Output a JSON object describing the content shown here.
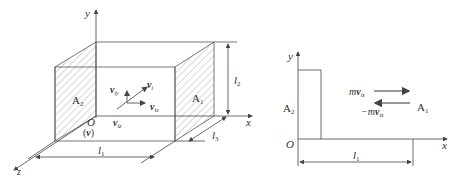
{
  "left_diagram": {
    "axes": {
      "x": "x",
      "y": "y",
      "z": "z",
      "origin": "O"
    },
    "faces": {
      "left": "A",
      "left_sub": "2",
      "right": "A",
      "right_sub": "1"
    },
    "dimensions": {
      "l1": {
        "main": "l",
        "sub": "1"
      },
      "l2": {
        "main": "l",
        "sub": "2"
      },
      "l3": {
        "main": "l",
        "sub": "3"
      }
    },
    "velocity": {
      "v_main": "v",
      "v_i_sub": "i",
      "v_iy_sub": "iy",
      "v_ix_sub": "ix",
      "v_iz_sub": "iz",
      "volume_label_open": "(",
      "volume_label_v": "v",
      "volume_label_close": ")"
    }
  },
  "right_diagram": {
    "axes": {
      "x": "x",
      "y": "y",
      "origin": "O"
    },
    "faces": {
      "left": "A",
      "left_sub": "2",
      "right": "A",
      "right_sub": "1"
    },
    "dimension": {
      "main": "l",
      "sub": "1"
    },
    "momentum": {
      "forward_m": "m",
      "forward_v": "v",
      "forward_sub": "ix",
      "backward_sign": "−m",
      "backward_v": "v",
      "backward_sub": "ix"
    }
  },
  "colors": {
    "line": "#555555",
    "hatch": "#888888",
    "text": "#333333",
    "arrow": "#777777"
  }
}
